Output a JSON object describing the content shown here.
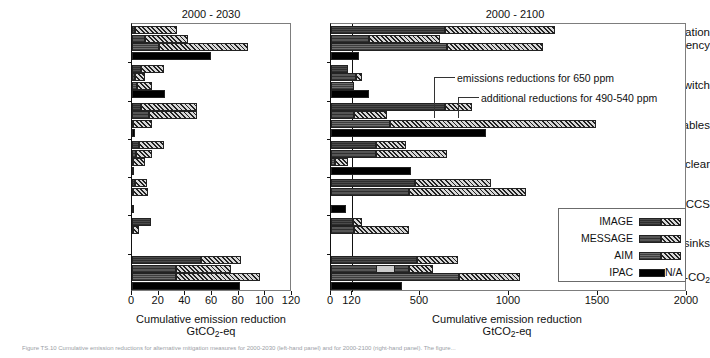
{
  "figure": {
    "caption": "Figure TS.10  Cumulative emission reductions for alternative mitigation measures for 2000-2030 (left-hand panel) and for 2000-2100 (right-hand panel). The figure..."
  },
  "panels": [
    {
      "id": "left",
      "title": "2000 - 2030",
      "xlabel_line1": "Cumulative emission reduction",
      "xlabel_line2": "GtCO",
      "xlabel_sub": "2",
      "xlabel_tail": "-eq",
      "xticks": [
        0,
        20,
        40,
        60,
        80,
        100,
        120
      ],
      "xmax": 120,
      "reference_line": null
    },
    {
      "id": "right",
      "title": "2000 - 2100",
      "xlabel_line1": "Cumulative emission reduction",
      "xlabel_line2": "GtCO",
      "xlabel_sub": "2",
      "xlabel_tail": "-eq",
      "xticks": [
        0,
        120,
        500,
        1000,
        1500,
        2000
      ],
      "xmax": 2000,
      "reference_line": 120
    }
  ],
  "categories": [
    "Energy conservation & efficiency",
    "Fossil fuel switch",
    "Renewables",
    "Nuclear",
    "CCS",
    "Forest sinks",
    "Non-CO2"
  ],
  "category_labels": [
    {
      "line1": "Energy conservation",
      "line2": "& efficiency"
    },
    {
      "line1": "Fossil fuel switch",
      "line2": ""
    },
    {
      "line1": "Renewables",
      "line2": ""
    },
    {
      "line1": "Nuclear",
      "line2": ""
    },
    {
      "line1": "CCS",
      "line2": ""
    },
    {
      "line1": "Forest sinks",
      "line2": ""
    },
    {
      "line1": "Non-CO",
      "sub": "2",
      "line2": ""
    }
  ],
  "legend": {
    "position": "bottom-right of right panel",
    "na_label": "N/A",
    "entries": [
      {
        "name": "IMAGE",
        "fill": "f-image",
        "has_hatch": true
      },
      {
        "name": "MESSAGE",
        "fill": "f-message",
        "has_hatch": true
      },
      {
        "name": "AIM",
        "fill": "f-aim",
        "has_hatch": true
      },
      {
        "name": "IPAC",
        "fill": "f-ipac",
        "has_hatch": false
      }
    ]
  },
  "annotations": [
    {
      "text": "emissions reductions for 650 ppm",
      "panel": "right"
    },
    {
      "text": "additional reductions for 490-540 ppm",
      "panel": "right"
    }
  ],
  "chart_data": {
    "type": "bar",
    "orientation": "horizontal",
    "xlabel": "Cumulative emission reduction GtCO2-eq",
    "ylabel": "",
    "grid": false,
    "legend_position": "inside lower-right",
    "series_names": [
      "IMAGE",
      "MESSAGE",
      "AIM",
      "IPAC"
    ],
    "stack_parts": [
      "emissions reductions for 650 ppm",
      "additional reductions for 490-540 ppm"
    ],
    "categories": [
      "Energy conservation & efficiency",
      "Fossil fuel switch",
      "Renewables",
      "Nuclear",
      "CCS",
      "Forest sinks",
      "Non-CO2"
    ],
    "panels": [
      {
        "name": "2000 - 2030",
        "xlim": [
          0,
          120
        ],
        "xticks": [
          0,
          20,
          40,
          60,
          80,
          100,
          120
        ],
        "data": {
          "Energy conservation & efficiency": {
            "IMAGE": {
              "base": 2,
              "additional": 32
            },
            "MESSAGE": {
              "base": 10,
              "additional": 32
            },
            "AIM": {
              "base": 20,
              "additional": 67
            },
            "IPAC": {
              "base": 59,
              "additional": 0
            }
          },
          "Fossil fuel switch": {
            "IMAGE": {
              "base": 7,
              "additional": 17
            },
            "MESSAGE": {
              "base": 2,
              "additional": 8
            },
            "AIM": {
              "base": 4,
              "additional": 11
            },
            "IPAC": {
              "base": 25,
              "additional": 0
            }
          },
          "Renewables": {
            "IMAGE": {
              "base": 7,
              "additional": 42
            },
            "MESSAGE": {
              "base": 13,
              "additional": 36
            },
            "AIM": {
              "base": 1,
              "additional": 14
            },
            "IPAC": {
              "base": 2,
              "additional": 0
            }
          },
          "Nuclear": {
            "IMAGE": {
              "base": 5,
              "additional": 19
            },
            "MESSAGE": {
              "base": 3,
              "additional": 12
            },
            "AIM": {
              "base": 1,
              "additional": 9
            },
            "IPAC": {
              "base": 1,
              "additional": 0
            }
          },
          "CCS": {
            "IMAGE": {
              "base": 2,
              "additional": 9
            },
            "MESSAGE": {
              "base": 1,
              "additional": 11
            },
            "AIM": {
              "base": 0,
              "additional": 0
            },
            "IPAC": {
              "base": 1,
              "additional": 0
            }
          },
          "Forest sinks": {
            "IMAGE": {
              "base": 14,
              "additional": 0
            },
            "MESSAGE": {
              "base": 1,
              "additional": 4
            },
            "AIM": {
              "base": 0,
              "additional": 0
            },
            "IPAC": {
              "base": 0,
              "additional": 0
            }
          },
          "Non-CO2": {
            "IMAGE": {
              "base": 52,
              "additional": 30
            },
            "MESSAGE": {
              "base": 33,
              "additional": 41
            },
            "AIM": {
              "base": 33,
              "additional": 63
            },
            "IPAC": {
              "base": 81,
              "additional": 0
            }
          }
        }
      },
      {
        "name": "2000 - 2100",
        "xlim": [
          0,
          2000
        ],
        "xticks": [
          0,
          120,
          500,
          1000,
          1500,
          2000
        ],
        "reference_line": 120,
        "data": {
          "Energy conservation & efficiency": {
            "IMAGE": {
              "base": 640,
              "additional": 620
            },
            "MESSAGE": {
              "base": 215,
              "additional": 400
            },
            "AIM": {
              "base": 650,
              "additional": 540
            },
            "IPAC": {
              "base": 155,
              "additional": 0
            }
          },
          "Fossil fuel switch": {
            "IMAGE": {
              "base": 95,
              "additional": 0
            },
            "MESSAGE": {
              "base": 140,
              "additional": 35
            },
            "AIM": {
              "base": 130,
              "additional": 0
            },
            "IPAC": {
              "base": 215,
              "additional": 0
            }
          },
          "Renewables": {
            "IMAGE": {
              "base": 640,
              "additional": 155
            },
            "MESSAGE": {
              "base": 130,
              "additional": 185
            },
            "AIM": {
              "base": 330,
              "additional": 1160
            },
            "IPAC": {
              "base": 870,
              "additional": 0
            }
          },
          "Nuclear": {
            "IMAGE": {
              "base": 250,
              "additional": 170
            },
            "MESSAGE": {
              "base": 250,
              "additional": 400
            },
            "AIM": {
              "base": 20,
              "additional": 75
            },
            "IPAC": {
              "base": 450,
              "additional": 0
            }
          },
          "CCS": {
            "IMAGE": {
              "base": 470,
              "additional": 430
            },
            "MESSAGE": {
              "base": 440,
              "additional": 655
            },
            "AIM": {
              "base": 0,
              "additional": 0
            },
            "IPAC": {
              "base": 85,
              "additional": 0
            }
          },
          "Forest sinks": {
            "IMAGE": {
              "base": 125,
              "additional": 50
            },
            "MESSAGE": {
              "base": 130,
              "additional": 310
            },
            "AIM": {
              "base": 0,
              "additional": 0
            },
            "IPAC": {
              "base": 0,
              "additional": 0
            }
          },
          "Non-CO2": {
            "IMAGE": {
              "base": 485,
              "additional": 230
            },
            "MESSAGE": {
              "base": 440,
              "additional": 135
            },
            "AIM": {
              "base": 720,
              "additional": 340
            },
            "IPAC": {
              "base": 400,
              "additional": 0
            }
          }
        }
      }
    ]
  }
}
